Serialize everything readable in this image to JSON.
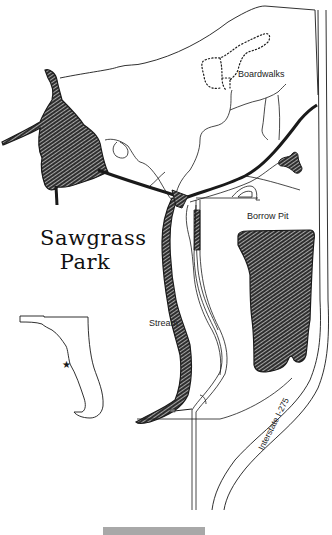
{
  "map": {
    "title_line1": "Sawgrass",
    "title_line2": "Park",
    "labels": {
      "boardwalks": "Boardwalks",
      "borrow_pit": "Borrow Pit",
      "stream": "Stream",
      "highway": "Interstate I-275"
    },
    "inset": "Florida locator map with star",
    "colors": {
      "ink": "#1a1a1a",
      "water_fill": "#3a3a3a",
      "background": "#ffffff",
      "footer_bar": "#a8a8a8"
    }
  }
}
